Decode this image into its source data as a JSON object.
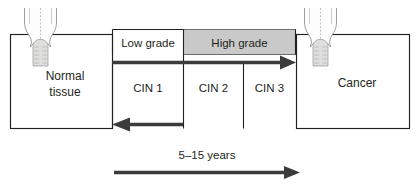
{
  "diagram": {
    "type": "medical-progression-diagram",
    "left_box": {
      "label_line1": "Normal",
      "label_line2": "tissue",
      "icon": "cervix-normal-illustration"
    },
    "right_box": {
      "label_line1": "Cancer",
      "icon": "cervix-cancer-illustration"
    },
    "grades": [
      {
        "label": "Low grade",
        "shaded": false,
        "fill": "#ffffff"
      },
      {
        "label": "High grade",
        "shaded": true,
        "fill": "#c9c9c9"
      }
    ],
    "stages": [
      {
        "label": "CIN 1"
      },
      {
        "label": "CIN 2"
      },
      {
        "label": "CIN 3"
      }
    ],
    "progression_arrow": {
      "name": "progression-arrow",
      "direction": "right",
      "description": "normal tissue to cancer"
    },
    "regression_arrow": {
      "name": "regression-arrow",
      "direction": "left",
      "description": "CIN 1 back to normal tissue"
    },
    "timeline": {
      "label": "5–15 years",
      "direction": "right"
    },
    "colors": {
      "outline": "#231f20",
      "arrow": "#3b3b3b",
      "high_grade_band": "#c9c9c9",
      "band_border": "#5f5f5f",
      "background": "#ffffff",
      "cervix_fill": "#dededd",
      "cervix_stroke": "#8d8d8d"
    }
  }
}
